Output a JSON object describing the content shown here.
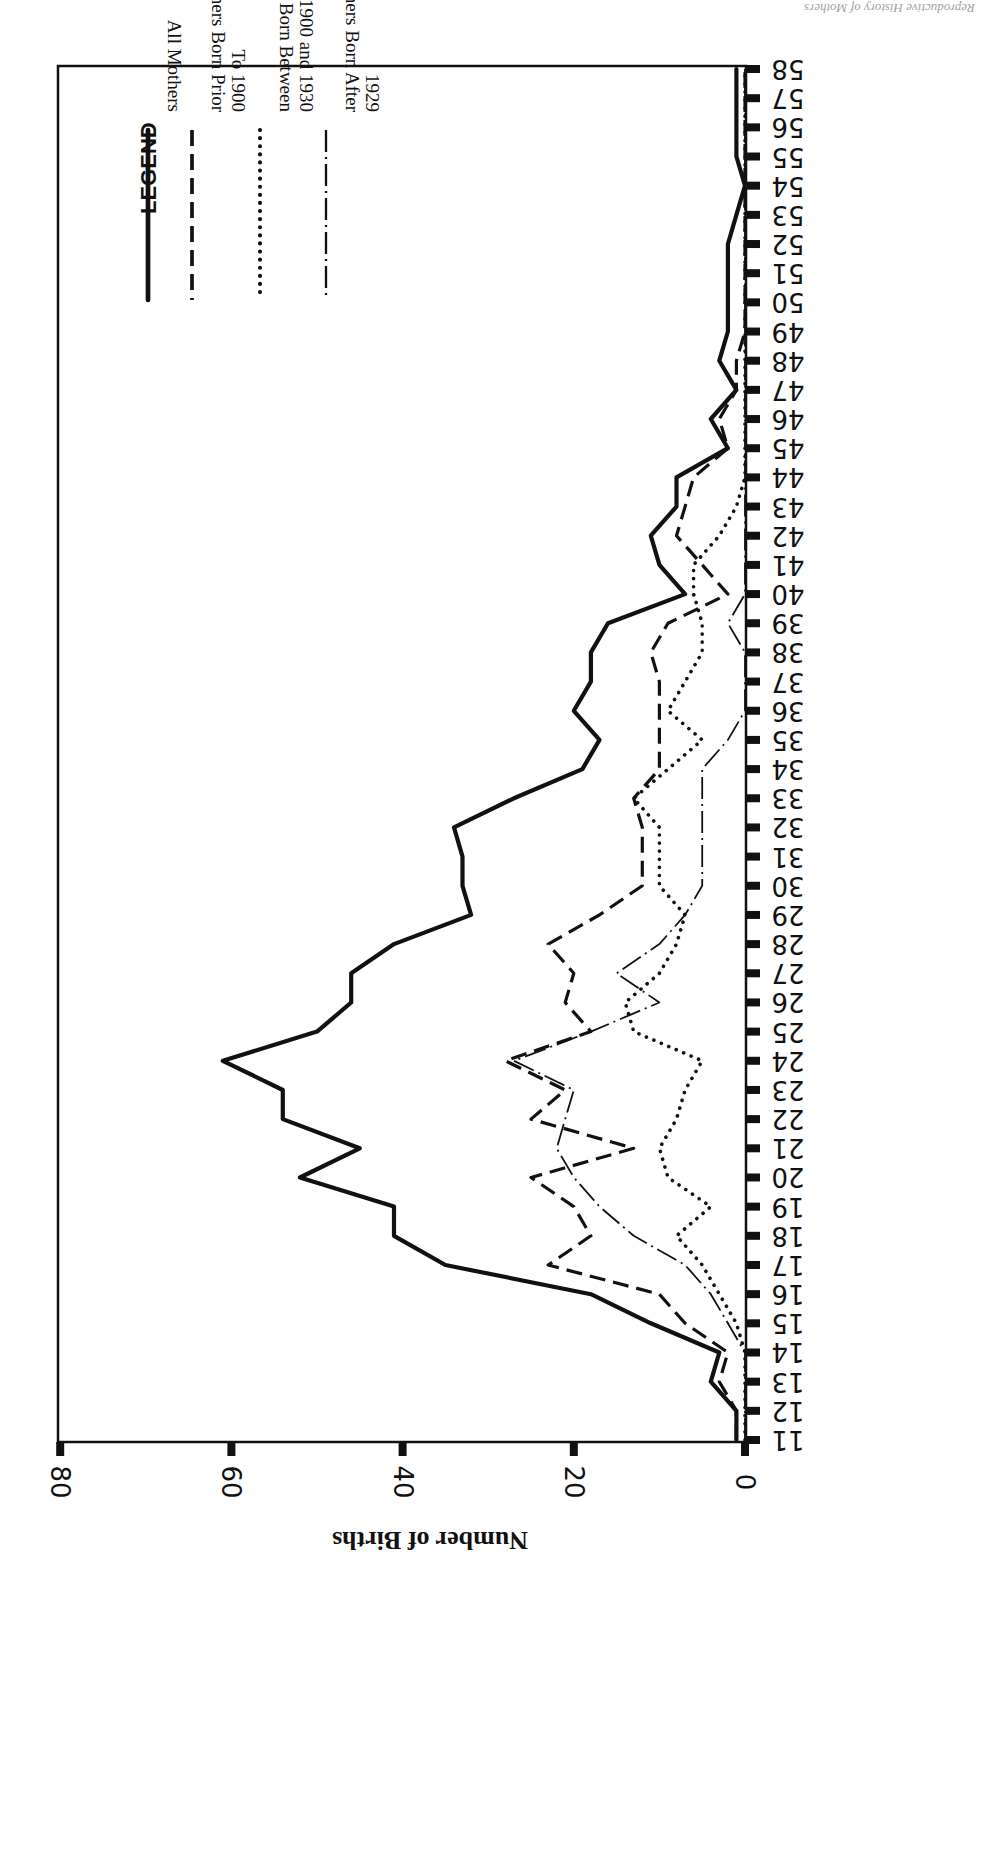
{
  "page": {
    "running_head": "Reproductive History of Mothers"
  },
  "chart_data": {
    "type": "line",
    "orientation": "rotated 180 degrees (printed upside-down)",
    "title": "",
    "xlabel": "Age of Mother",
    "ylabel": "Number of Births",
    "ylim": [
      0,
      80
    ],
    "y_ticks": [
      0,
      20,
      40,
      60,
      80
    ],
    "x": [
      11,
      12,
      13,
      14,
      15,
      16,
      17,
      18,
      19,
      20,
      21,
      22,
      23,
      24,
      25,
      26,
      27,
      28,
      29,
      30,
      31,
      32,
      33,
      34,
      35,
      36,
      37,
      38,
      39,
      40,
      41,
      42,
      43,
      44,
      45,
      46,
      47,
      48,
      49,
      50,
      51,
      52,
      53,
      54,
      55,
      56,
      57,
      58
    ],
    "grid": false,
    "legend_position": "upper-right (rotated)",
    "legend_title": "LEGEND",
    "series": [
      {
        "name": "All Mothers",
        "style": "solid",
        "values": [
          1,
          1,
          4,
          3,
          11,
          18,
          35,
          41,
          41,
          52,
          45,
          54,
          54,
          61,
          50,
          46,
          46,
          41,
          32,
          33,
          33,
          34,
          27,
          19,
          17,
          20,
          18,
          18,
          16,
          7,
          10,
          11,
          8,
          8,
          2,
          4,
          1,
          3,
          2,
          2,
          2,
          2,
          1,
          0,
          1,
          1,
          1,
          1
        ]
      },
      {
        "name": "Mothers Born Prior To 1900",
        "style": "dashed",
        "values": [
          1,
          1,
          3,
          2,
          7,
          10,
          23,
          18,
          20,
          25,
          13,
          25,
          21,
          28,
          18,
          21,
          20,
          23,
          17,
          12,
          12,
          12,
          13,
          10,
          10,
          10,
          10,
          11,
          9,
          2,
          5,
          8,
          7,
          6,
          2,
          3,
          1,
          1,
          0,
          0,
          0,
          0,
          0,
          0,
          0,
          0,
          0,
          0
        ]
      },
      {
        "name": "Mothers Born Between 1900 and 1930",
        "style": "dotted",
        "values": [
          0,
          0,
          0,
          0,
          1,
          3,
          5,
          8,
          4,
          9,
          10,
          8,
          7,
          5,
          13,
          14,
          10,
          8,
          7,
          10,
          10,
          10,
          13,
          9,
          5,
          9,
          7,
          5,
          5,
          6,
          6,
          3,
          1,
          0,
          0,
          0,
          0,
          0,
          0,
          0,
          0,
          0,
          0,
          0,
          0,
          0,
          0,
          0
        ]
      },
      {
        "name": "Mothers Born After 1929",
        "style": "dash-dot",
        "values": [
          0,
          0,
          0,
          0,
          2,
          4,
          7,
          13,
          17,
          20,
          22,
          21,
          20,
          27,
          18,
          10,
          15,
          10,
          7,
          5,
          5,
          5,
          5,
          5,
          2,
          0,
          0,
          0,
          2,
          0,
          0,
          0,
          0,
          0,
          0,
          0,
          0,
          0,
          0,
          0,
          0,
          0,
          0,
          0,
          0,
          0,
          0,
          0
        ]
      }
    ]
  },
  "legend": {
    "title": "LEGEND",
    "items": [
      {
        "line1": "All Mothers",
        "line2": ""
      },
      {
        "line1": "Mothers Born Prior",
        "line2": "To 1900"
      },
      {
        "line1": "Mothers Born Between",
        "line2": "1900 and 1930"
      },
      {
        "line1": "Mothers Born After",
        "line2": "1929"
      }
    ]
  }
}
